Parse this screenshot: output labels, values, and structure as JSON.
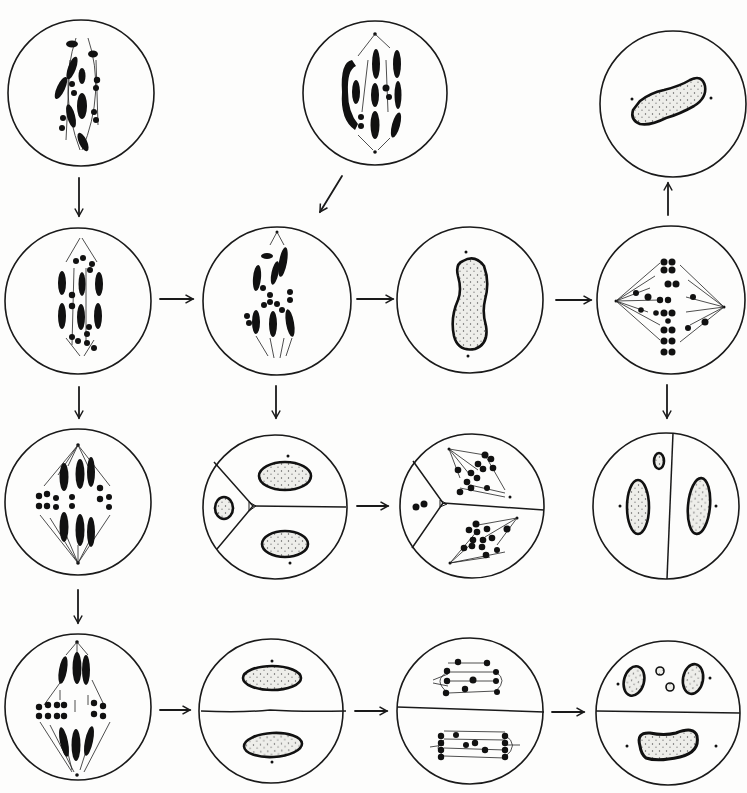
{
  "figure": {
    "colors": {
      "ink": "#111111",
      "paper": "#fdfdfc",
      "nucleus_fill": "#eeeeea"
    }
  },
  "cells": [
    {
      "id": "r1c1",
      "cx": 81,
      "cy": 93,
      "r": 73,
      "content": "spindle-chromosomes-irregular"
    },
    {
      "id": "r1c2",
      "cx": 375,
      "cy": 93,
      "r": 72,
      "content": "spindle-chromosomes-paired-elongated"
    },
    {
      "id": "r1c4",
      "cx": 673,
      "cy": 104,
      "r": 73,
      "content": "single-nucleus-diagonal"
    },
    {
      "id": "r2c1",
      "cx": 78,
      "cy": 301,
      "r": 73,
      "content": "spindle-chromosomes-metaphase"
    },
    {
      "id": "r2c2",
      "cx": 277,
      "cy": 301,
      "r": 74,
      "content": "spindle-chromosomes-scattered"
    },
    {
      "id": "r2c3",
      "cx": 470,
      "cy": 300,
      "r": 73,
      "content": "single-nucleus-vertical"
    },
    {
      "id": "r2c4",
      "cx": 671,
      "cy": 300,
      "r": 74,
      "content": "spindle-horizontal-dot-chromosomes"
    },
    {
      "id": "r3c1",
      "cx": 78,
      "cy": 502,
      "r": 73,
      "content": "spindle-diamond-metaphase"
    },
    {
      "id": "r3c2",
      "cx": 275,
      "cy": 507,
      "r": 72,
      "content": "three-compartments-nuclei"
    },
    {
      "id": "r3c3",
      "cx": 472,
      "cy": 506,
      "r": 72,
      "content": "three-compartments-spindles"
    },
    {
      "id": "r3c4",
      "cx": 666,
      "cy": 506,
      "r": 73,
      "content": "vertical-wall-two-nuclei"
    },
    {
      "id": "r4c1",
      "cx": 78,
      "cy": 707,
      "r": 73,
      "content": "spindle-anaphase"
    },
    {
      "id": "r4c2",
      "cx": 271,
      "cy": 711,
      "r": 72,
      "content": "horizontal-wall-two-nuclei"
    },
    {
      "id": "r4c3",
      "cx": 470,
      "cy": 711,
      "r": 73,
      "content": "horizontal-wall-two-spindles"
    },
    {
      "id": "r4c4",
      "cx": 668,
      "cy": 713,
      "r": 72,
      "content": "horizontal-wall-micronuclei"
    }
  ],
  "arrows": [
    {
      "id": "a1",
      "from": "r1c1",
      "to": "r2c1",
      "direction": "down"
    },
    {
      "id": "a2",
      "from": "r1c2",
      "to": "r2c2",
      "direction": "down-left"
    },
    {
      "id": "a3",
      "from": "r2c4",
      "to": "r1c4",
      "direction": "up"
    },
    {
      "id": "a4",
      "from": "r2c1",
      "to": "r2c2",
      "direction": "right"
    },
    {
      "id": "a5",
      "from": "r2c2",
      "to": "r2c3",
      "direction": "right"
    },
    {
      "id": "a6",
      "from": "r2c3",
      "to": "r2c4",
      "direction": "right"
    },
    {
      "id": "a7",
      "from": "r2c1",
      "to": "r3c1",
      "direction": "down"
    },
    {
      "id": "a8",
      "from": "r2c2",
      "to": "r3c2",
      "direction": "down"
    },
    {
      "id": "a9",
      "from": "r2c4",
      "to": "r3c4",
      "direction": "down"
    },
    {
      "id": "a10",
      "from": "r3c2",
      "to": "r3c3",
      "direction": "right"
    },
    {
      "id": "a11",
      "from": "r3c1",
      "to": "r4c1",
      "direction": "down"
    },
    {
      "id": "a12",
      "from": "r4c1",
      "to": "r4c2",
      "direction": "right"
    },
    {
      "id": "a13",
      "from": "r4c2",
      "to": "r4c3",
      "direction": "right"
    },
    {
      "id": "a14",
      "from": "r4c3",
      "to": "r4c4",
      "direction": "right"
    }
  ]
}
